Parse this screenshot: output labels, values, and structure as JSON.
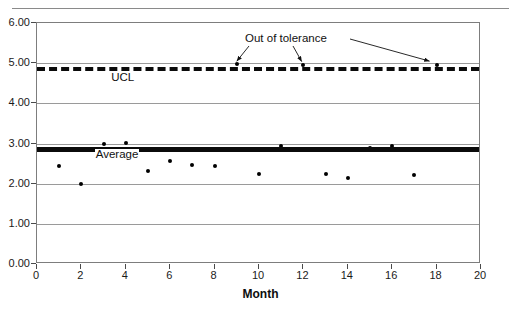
{
  "chart_data": {
    "type": "scatter",
    "title": "",
    "xlabel": "Month",
    "ylabel": "",
    "xlim": [
      0,
      20
    ],
    "ylim": [
      0,
      6
    ],
    "grid": true,
    "legend_position": "none",
    "x_ticks": [
      "0",
      "2",
      "4",
      "6",
      "8",
      "10",
      "12",
      "14",
      "16",
      "18",
      "20"
    ],
    "x_tick_values": [
      0,
      2,
      4,
      6,
      8,
      10,
      12,
      14,
      16,
      18,
      20
    ],
    "y_ticks": [
      "0.00",
      "1.00",
      "2.00",
      "3.00",
      "4.00",
      "5.00",
      "6.00"
    ],
    "y_tick_values": [
      0,
      1,
      2,
      3,
      4,
      5,
      6
    ],
    "series": [
      {
        "name": "Measurement",
        "type": "scatter",
        "marker": "dot",
        "color": "#000000",
        "x": [
          1,
          2,
          3,
          4,
          5,
          6,
          7,
          8,
          9,
          10,
          11,
          12,
          13,
          14,
          15,
          16,
          17,
          18
        ],
        "values": [
          2.44,
          1.98,
          2.99,
          3.02,
          2.31,
          2.56,
          2.47,
          2.44,
          4.97,
          2.25,
          2.95,
          4.96,
          2.25,
          2.15,
          2.88,
          2.95,
          2.21,
          4.95
        ]
      },
      {
        "name": "UCL",
        "type": "line",
        "style": "dashed",
        "color": "#0b0b0b",
        "value": 4.9
      },
      {
        "name": "Average",
        "type": "line",
        "style": "solid-thick",
        "color": "#0b0b0b",
        "value": 2.87
      }
    ],
    "annotations": [
      {
        "text": "Out of tolerance",
        "points_to": [
          {
            "x": 9,
            "y": 4.97
          },
          {
            "x": 12,
            "y": 4.96
          },
          {
            "x": 18,
            "y": 4.95
          }
        ]
      },
      {
        "text": "UCL",
        "x": 3.3,
        "y": 4.63
      },
      {
        "text": "Average",
        "x": 2.6,
        "y": 2.72
      }
    ]
  },
  "labels": {
    "ucl": "UCL",
    "average": "Average",
    "out_of_tolerance": "Out of tolerance",
    "x_axis_title": "Month"
  }
}
